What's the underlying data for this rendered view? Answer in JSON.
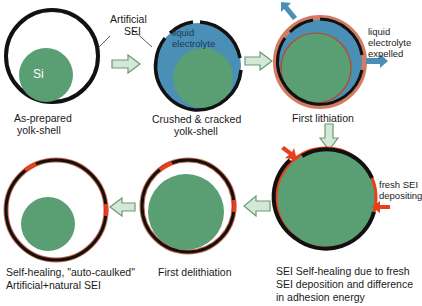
{
  "colors": {
    "si_green": "#5a9e73",
    "electrolyte_blue": "#4a8fb5",
    "shell_black": "#111111",
    "natural_sei_red": "#e8401c",
    "arrow_fill": "#d3e8d6",
    "arrow_stroke": "#6a9a78"
  },
  "stages": [
    {
      "id": "as-prepared",
      "caption_line1": "As-prepared",
      "caption_line2": "yolk-shell",
      "core_label": "Si"
    },
    {
      "id": "crushed",
      "caption_line1": "Crushed & cracked",
      "caption_line2": "yolk-shell",
      "inner_label_line1": "liquid",
      "inner_label_line2": "electrolyte"
    },
    {
      "id": "first-lithiation",
      "caption": "First lithiation",
      "side_label_line1": "liquid",
      "side_label_line2": "electrolyte",
      "side_label_line3": "expelled"
    },
    {
      "id": "self-healing",
      "caption_line1": "SEI Self-healing due to fresh",
      "caption_line2": "SEI deposition and difference",
      "caption_line3": "in adhesion energy",
      "side_label_line1": "fresh SEI",
      "side_label_line2": "depositing"
    },
    {
      "id": "first-delithiation",
      "caption": "First delithiation"
    },
    {
      "id": "auto-caulked",
      "caption_line1": "Self-healing, \"auto-caulked\"",
      "caption_line2": "Artificial+natural SEI"
    }
  ],
  "annotations": {
    "artificial_sei_line1": "Artificial",
    "artificial_sei_line2": "SEI"
  }
}
